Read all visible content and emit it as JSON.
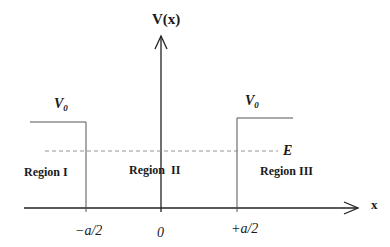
{
  "diagram": {
    "axis_y_label": "V(x)",
    "axis_x_label": "x",
    "barrier_left_label": {
      "main": "V",
      "sub": "0"
    },
    "barrier_right_label": {
      "main": "V",
      "sub": "0"
    },
    "energy_label": "E",
    "regions": [
      {
        "label": "Region I"
      },
      {
        "label": "Region  II"
      },
      {
        "label": "Region III"
      }
    ],
    "ticks": [
      {
        "label": "−a/2"
      },
      {
        "label": "0"
      },
      {
        "label": "+a/2"
      }
    ],
    "colors": {
      "axis": "#222222",
      "potential": "#555555",
      "energy_dashed": "#888888",
      "text": "#1a1a1a"
    }
  }
}
